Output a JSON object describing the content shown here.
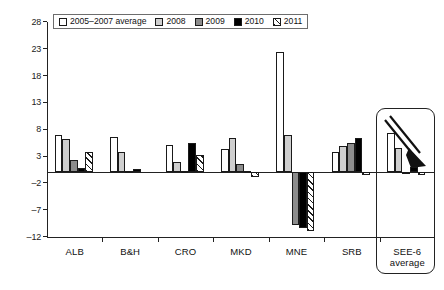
{
  "chart_data": {
    "type": "bar",
    "title": "",
    "subtitle": "",
    "xlabel": "",
    "ylabel": "",
    "ylim": [
      -12,
      28
    ],
    "yticks": [
      28,
      23,
      18,
      13,
      8,
      3,
      -2,
      -7,
      -12
    ],
    "grid": false,
    "legend_position": "top-left",
    "categories": [
      "ALB",
      "B&H",
      "CRO",
      "MKD",
      "MNE",
      "SRB",
      "SEE-6 average"
    ],
    "category_labels": [
      {
        "line1": "ALB",
        "line2": ""
      },
      {
        "line1": "B&H",
        "line2": ""
      },
      {
        "line1": "CRO",
        "line2": ""
      },
      {
        "line1": "MKD",
        "line2": ""
      },
      {
        "line1": "MNE",
        "line2": ""
      },
      {
        "line1": "SRB",
        "line2": ""
      },
      {
        "line1": "SEE-6",
        "line2": "average"
      }
    ],
    "series": [
      {
        "name": "2005–2007 average",
        "color": "#ffffff",
        "pattern": "solid",
        "values": [
          6.9,
          6.5,
          5.0,
          4.3,
          22.4,
          3.7,
          7.3
        ]
      },
      {
        "name": "2008",
        "color": "#cfcfcf",
        "pattern": "solid",
        "values": [
          6.1,
          3.7,
          1.9,
          6.3,
          7.0,
          4.8,
          4.5
        ]
      },
      {
        "name": "2009",
        "color": "#8c8c8c",
        "pattern": "solid",
        "values": [
          2.2,
          0.2,
          0.3,
          1.5,
          -9.9,
          5.4,
          -0.1
        ]
      },
      {
        "name": "2010",
        "color": "#000000",
        "pattern": "solid",
        "values": [
          0.7,
          0.6,
          5.4,
          0.3,
          -10.4,
          6.3,
          0.9
        ]
      },
      {
        "name": "2011",
        "color": "#ffffff",
        "pattern": "hatch",
        "values": [
          3.7,
          0.0,
          3.2,
          -0.8,
          -11.0,
          -0.6,
          -0.5
        ]
      }
    ],
    "annotations": [
      {
        "type": "highlight-box",
        "target": "SEE-6 average"
      },
      {
        "type": "arrow",
        "target": "SEE-6 average",
        "direction": "down-right"
      }
    ]
  },
  "legend": {
    "items": [
      {
        "label": "2005–2007 average",
        "swatch": "swatch-2005-2007"
      },
      {
        "label": "2008",
        "swatch": "swatch-2008"
      },
      {
        "label": "2009",
        "swatch": "swatch-2009"
      },
      {
        "label": "2010",
        "swatch": "swatch-2010"
      },
      {
        "label": "2011",
        "swatch": "swatch-2011"
      }
    ]
  }
}
